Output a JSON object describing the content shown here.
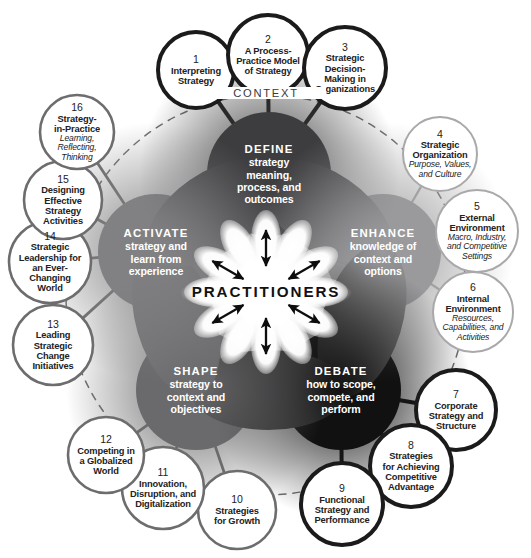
{
  "diagram": {
    "center_label": "PRACTITIONERS",
    "context_label": "CONTEXT",
    "colors": {
      "define_hub": "#3d3d3f",
      "enhance_hub": "#9a9a9c",
      "debate_hub": "#111111",
      "shape_hub": "#6a6a6c",
      "activate_hub": "#818183",
      "stroke_dark": "#1b1b1b",
      "stroke_mid": "#6d6d6f",
      "stroke_light": "#a9a9ab",
      "text_dark": "#222222",
      "hub_text": "#ffffff",
      "background": "#ffffff"
    },
    "hubs": [
      {
        "key": "define",
        "head": "DEFINE",
        "body": "strategy\nmeaning,\nprocess, and\noutcomes",
        "color": "#3d3d3f",
        "cx": 269,
        "cy": 174,
        "r": 62
      },
      {
        "key": "enhance",
        "head": "ENHANCE",
        "body": "knowledge of\ncontext and\noptions",
        "color": "#9a9a9c",
        "cx": 383,
        "cy": 252,
        "r": 58
      },
      {
        "key": "debate",
        "head": "DEBATE",
        "body": "how to scope,\ncompete, and\nperform",
        "color": "#111111",
        "cx": 341,
        "cy": 390,
        "r": 60
      },
      {
        "key": "shape",
        "head": "SHAPE",
        "body": "strategy to\ncontext and\nobjectives",
        "color": "#6a6a6c",
        "cx": 196,
        "cy": 390,
        "r": 60
      },
      {
        "key": "activate",
        "head": "ACTIVATE",
        "body": "strategy and\nlearn from\nexperience",
        "color": "#818183",
        "cx": 156,
        "cy": 252,
        "r": 58
      }
    ],
    "nodes": [
      {
        "num": "1",
        "title": "Interpreting\nStrategy",
        "sub": "",
        "cx": 196,
        "cy": 70,
        "r": 38,
        "tone": "dark",
        "hub": "define"
      },
      {
        "num": "2",
        "title": "A Process-\nPractice Model\nof Strategy",
        "sub": "",
        "cx": 268,
        "cy": 55,
        "r": 40,
        "tone": "dark",
        "hub": "define"
      },
      {
        "num": "3",
        "title": "Strategic\nDecision-\nMaking in\nOrganizations",
        "sub": "",
        "cx": 345,
        "cy": 68,
        "r": 41,
        "tone": "dark",
        "hub": "define"
      },
      {
        "num": "4",
        "title": "Strategic\nOrganization",
        "sub": "Purpose, Values,\nand Culture",
        "cx": 440,
        "cy": 154,
        "r": 37,
        "tone": "light",
        "hub": "enhance"
      },
      {
        "num": "5",
        "title": "External\nEnvironment",
        "sub": "Macro, Industry,\nand Competitive\nSettings",
        "cx": 477,
        "cy": 231,
        "r": 41,
        "tone": "light",
        "hub": "enhance"
      },
      {
        "num": "6",
        "title": "Internal\nEnvironment",
        "sub": "Resources,\nCapabilities, and\nActivities",
        "cx": 473,
        "cy": 312,
        "r": 40,
        "tone": "light",
        "hub": "enhance"
      },
      {
        "num": "7",
        "title": "Corporate\nStrategy and\nStructure",
        "sub": "",
        "cx": 456,
        "cy": 410,
        "r": 40,
        "tone": "dark",
        "hub": "debate"
      },
      {
        "num": "8",
        "title": "Strategies\nfor Achieving\nCompetitive\nAdvantage",
        "sub": "",
        "cx": 411,
        "cy": 466,
        "r": 41,
        "tone": "dark",
        "hub": "debate"
      },
      {
        "num": "9",
        "title": "Functional\nStrategy and\nPerformance",
        "sub": "",
        "cx": 342,
        "cy": 504,
        "r": 41,
        "tone": "dark",
        "hub": "debate"
      },
      {
        "num": "10",
        "title": "Strategies\nfor Growth",
        "sub": "",
        "cx": 237,
        "cy": 510,
        "r": 39,
        "tone": "mid",
        "hub": "shape"
      },
      {
        "num": "11",
        "title": "Innovation,\nDisruption, and\nDigitalization",
        "sub": "",
        "cx": 163,
        "cy": 488,
        "r": 41,
        "tone": "mid",
        "hub": "shape"
      },
      {
        "num": "12",
        "title": "Competing in\na Globalized\nWorld",
        "sub": "",
        "cx": 106,
        "cy": 455,
        "r": 38,
        "tone": "mid",
        "hub": "shape"
      },
      {
        "num": "13",
        "title": "Leading\nStrategic\nChange\nInitiatives",
        "sub": "",
        "cx": 53,
        "cy": 345,
        "r": 40,
        "tone": "mid",
        "hub": "activate"
      },
      {
        "num": "14",
        "title": "Strategic\nLeadership for\nan Ever-\nChanging\nWorld",
        "sub": "",
        "cx": 50,
        "cy": 262,
        "r": 41,
        "tone": "mid",
        "hub": "activate"
      },
      {
        "num": "15",
        "title": "Designing\nEffective\nStrategy\nActivities",
        "sub": "",
        "cx": 63,
        "cy": 200,
        "r": 39,
        "tone": "mid",
        "hub": "activate"
      },
      {
        "num": "16",
        "title": "Strategy-\nin-Practice",
        "sub": "Learning,\nReflecting,\nThinking",
        "cx": 77,
        "cy": 132,
        "r": 37,
        "tone": "mid",
        "hub": "activate"
      }
    ],
    "context_ring": {
      "cx": 266,
      "cy": 295,
      "r": 200,
      "dashed": true
    }
  }
}
